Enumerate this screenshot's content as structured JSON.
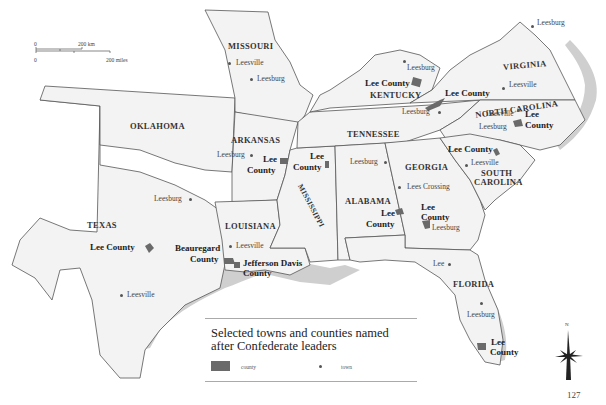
{
  "map": {
    "title": "Selected towns and counties named after Confederate leaders",
    "title_line1": "Selected towns and counties named",
    "title_line2": "after Confederate leaders",
    "page_number": "127",
    "colors": {
      "land": "#f3f3f3",
      "border": "#555555",
      "county_fill": "#6a6a6a",
      "coast_shade": "#c8c8c8"
    }
  },
  "scale_bar": {
    "km_zero": "0",
    "km_label": "200 km",
    "mi_zero": "0",
    "mi_label": "200 miles"
  },
  "legend": {
    "county_label": "county",
    "town_label": "town"
  },
  "compass": {
    "north_label": "N"
  },
  "states": {
    "missouri": "MISSOURI",
    "kentucky": "KENTUCKY",
    "virginia": "VIRGINIA",
    "north_carolina": "NORTH CAROLINA",
    "tennessee": "TENNESSEE",
    "oklahoma": "OKLAHOMA",
    "arkansas": "ARKANSAS",
    "mississippi": "MISSISSIPPI",
    "alabama": "ALABAMA",
    "georgia": "GEORGIA",
    "south_carolina_1": "SOUTH",
    "south_carolina_2": "CAROLINA",
    "texas": "TEXAS",
    "louisiana": "LOUISIANA",
    "florida": "FLORIDA"
  },
  "towns": {
    "mo_leesville": "Leesville",
    "mo_leesburg": "Leesburg",
    "ky_leesburg": "Leesburg",
    "va_leesburg": "Leesburg",
    "va_leesville": "Leesville",
    "tn_leesburg": "Leesburg",
    "nc_leesville": "Leesville",
    "nc_leesburg": "Leesburg",
    "ar_leesburg": "Leesburg",
    "al_leesburg": "Leesburg",
    "ga_lees_crossing": "Lees Crossing",
    "ga_leesburg": "Leesburg",
    "sc_leesville": "Leesville",
    "tx_leesburg": "Leesburg",
    "tx_leesville": "Leesville",
    "la_leesville": "Leesville",
    "fl_lee": "Lee",
    "fl_leesburg": "Leesburg"
  },
  "counties": {
    "ky_lee": "Lee County",
    "va_lee": "Lee County",
    "nc_lee_1": "Lee",
    "nc_lee_2": "County",
    "ar_lee_1": "Lee",
    "ar_lee_2": "County",
    "ms_lee_1": "Lee",
    "ms_lee_2": "County",
    "al_lee_1": "Lee",
    "al_lee_2": "County",
    "ga_lee_1": "Lee",
    "ga_lee_2": "County",
    "sc_lee": "Lee County",
    "tx_lee": "Lee County",
    "la_beauregard_1": "Beauregard",
    "la_beauregard_2": "County",
    "la_jeff_davis_1": "Jefferson Davis",
    "la_jeff_davis_2": "County",
    "fl_lee_1": "Lee",
    "fl_lee_2": "County"
  }
}
